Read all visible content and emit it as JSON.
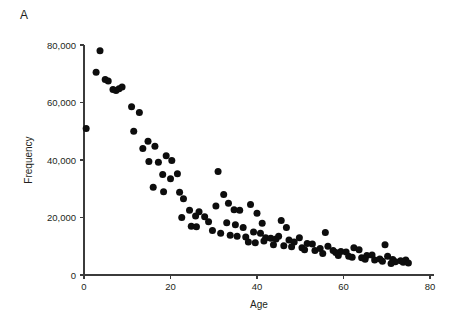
{
  "figure": {
    "panel_label": "A",
    "background_color": "#ffffff",
    "marker_color": "#0d0d0d",
    "axis_color": "#3b3b3b"
  },
  "chart_data": {
    "type": "scatter",
    "title": "",
    "panel": "A",
    "xlabel": "Age",
    "ylabel": "Frequency",
    "xlim": [
      0,
      80
    ],
    "ylim": [
      0,
      85000
    ],
    "xticks": [
      0,
      20,
      40,
      60,
      80
    ],
    "xtick_labels": [
      "0",
      "20",
      "40",
      "60",
      "80"
    ],
    "yticks": [
      0,
      20000,
      40000,
      60000,
      80000
    ],
    "ytick_labels": [
      "0",
      "20,000",
      "40,000",
      "60,000",
      "80,000"
    ],
    "grid": false,
    "legend": null,
    "marker_size_px": 4.4,
    "points": [
      {
        "x": 0.5,
        "y": 51000
      },
      {
        "x": 2.8,
        "y": 70500
      },
      {
        "x": 3.7,
        "y": 78000
      },
      {
        "x": 4.9,
        "y": 68000
      },
      {
        "x": 5.6,
        "y": 67500
      },
      {
        "x": 6.7,
        "y": 64500
      },
      {
        "x": 7.4,
        "y": 64200
      },
      {
        "x": 8.1,
        "y": 64800
      },
      {
        "x": 8.8,
        "y": 65400
      },
      {
        "x": 11.0,
        "y": 58500
      },
      {
        "x": 12.8,
        "y": 56500
      },
      {
        "x": 11.5,
        "y": 50000
      },
      {
        "x": 14.8,
        "y": 46500
      },
      {
        "x": 13.6,
        "y": 44000
      },
      {
        "x": 16.4,
        "y": 44800
      },
      {
        "x": 15.0,
        "y": 39500
      },
      {
        "x": 17.2,
        "y": 39200
      },
      {
        "x": 19.0,
        "y": 41500
      },
      {
        "x": 20.3,
        "y": 39800
      },
      {
        "x": 18.2,
        "y": 35000
      },
      {
        "x": 20.0,
        "y": 33500
      },
      {
        "x": 21.6,
        "y": 35200
      },
      {
        "x": 16.0,
        "y": 30500
      },
      {
        "x": 18.4,
        "y": 29000
      },
      {
        "x": 22.1,
        "y": 28800
      },
      {
        "x": 23.0,
        "y": 26500
      },
      {
        "x": 24.4,
        "y": 22500
      },
      {
        "x": 25.8,
        "y": 20500
      },
      {
        "x": 22.6,
        "y": 20000
      },
      {
        "x": 26.6,
        "y": 22000
      },
      {
        "x": 27.9,
        "y": 20300
      },
      {
        "x": 28.8,
        "y": 18500
      },
      {
        "x": 24.8,
        "y": 17000
      },
      {
        "x": 26.0,
        "y": 16800
      },
      {
        "x": 29.7,
        "y": 15500
      },
      {
        "x": 31.0,
        "y": 36000
      },
      {
        "x": 32.3,
        "y": 28000
      },
      {
        "x": 33.4,
        "y": 25000
      },
      {
        "x": 30.5,
        "y": 24000
      },
      {
        "x": 34.7,
        "y": 22700
      },
      {
        "x": 36.0,
        "y": 22500
      },
      {
        "x": 33.0,
        "y": 18200
      },
      {
        "x": 35.0,
        "y": 17500
      },
      {
        "x": 36.8,
        "y": 16500
      },
      {
        "x": 31.6,
        "y": 14500
      },
      {
        "x": 33.8,
        "y": 13800
      },
      {
        "x": 35.4,
        "y": 13500
      },
      {
        "x": 37.4,
        "y": 13200
      },
      {
        "x": 38.5,
        "y": 24500
      },
      {
        "x": 40.0,
        "y": 21500
      },
      {
        "x": 41.2,
        "y": 18000
      },
      {
        "x": 39.2,
        "y": 15000
      },
      {
        "x": 40.8,
        "y": 14500
      },
      {
        "x": 42.0,
        "y": 13000
      },
      {
        "x": 43.2,
        "y": 12800
      },
      {
        "x": 38.0,
        "y": 11500
      },
      {
        "x": 39.6,
        "y": 11200
      },
      {
        "x": 41.6,
        "y": 11800
      },
      {
        "x": 44.4,
        "y": 12500
      },
      {
        "x": 45.6,
        "y": 19000
      },
      {
        "x": 46.8,
        "y": 16500
      },
      {
        "x": 45.0,
        "y": 13500
      },
      {
        "x": 47.4,
        "y": 12200
      },
      {
        "x": 43.8,
        "y": 10500
      },
      {
        "x": 46.2,
        "y": 10200
      },
      {
        "x": 48.6,
        "y": 11500
      },
      {
        "x": 49.8,
        "y": 13000
      },
      {
        "x": 48.0,
        "y": 9800
      },
      {
        "x": 50.4,
        "y": 9500
      },
      {
        "x": 51.6,
        "y": 11000
      },
      {
        "x": 52.8,
        "y": 10800
      },
      {
        "x": 51.0,
        "y": 8800
      },
      {
        "x": 53.4,
        "y": 8500
      },
      {
        "x": 54.6,
        "y": 9200
      },
      {
        "x": 55.8,
        "y": 14800
      },
      {
        "x": 56.4,
        "y": 10000
      },
      {
        "x": 57.6,
        "y": 8500
      },
      {
        "x": 55.2,
        "y": 7500
      },
      {
        "x": 58.2,
        "y": 7800
      },
      {
        "x": 59.4,
        "y": 8200
      },
      {
        "x": 60.6,
        "y": 8000
      },
      {
        "x": 58.8,
        "y": 6800
      },
      {
        "x": 61.2,
        "y": 6500
      },
      {
        "x": 62.4,
        "y": 9500
      },
      {
        "x": 63.6,
        "y": 8800
      },
      {
        "x": 62.0,
        "y": 6200
      },
      {
        "x": 64.2,
        "y": 6000
      },
      {
        "x": 65.4,
        "y": 6800
      },
      {
        "x": 66.6,
        "y": 7000
      },
      {
        "x": 65.0,
        "y": 5500
      },
      {
        "x": 67.2,
        "y": 5200
      },
      {
        "x": 68.4,
        "y": 5600
      },
      {
        "x": 69.6,
        "y": 10500
      },
      {
        "x": 70.2,
        "y": 6500
      },
      {
        "x": 71.4,
        "y": 5400
      },
      {
        "x": 69.0,
        "y": 4800
      },
      {
        "x": 72.0,
        "y": 4600
      },
      {
        "x": 73.2,
        "y": 5000
      },
      {
        "x": 74.4,
        "y": 5200
      },
      {
        "x": 73.8,
        "y": 4400
      },
      {
        "x": 75.0,
        "y": 4200
      },
      {
        "x": 71.0,
        "y": 4000
      }
    ]
  }
}
